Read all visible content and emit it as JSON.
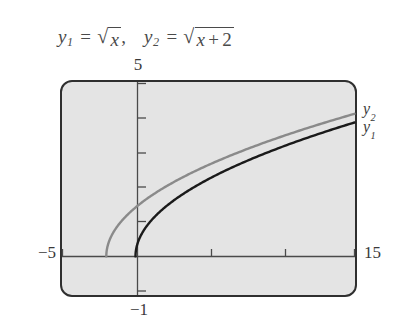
{
  "caption": {
    "eq1": {
      "var": "y",
      "sub": "1",
      "equals": "=",
      "radical": "√",
      "radicand": "x",
      "trailing": ","
    },
    "eq2": {
      "var": "y",
      "sub": "2",
      "equals": "=",
      "radical": "√",
      "radicand_var": "x",
      "operator": "+",
      "radicand_num": "2"
    },
    "plain_text": "y₁ = √x,  y₂ = √(x + 2)"
  },
  "axis_labels": {
    "y_max": "5",
    "y_min": "−1",
    "x_min": "−5",
    "x_max": "15"
  },
  "curve_labels": {
    "y2": {
      "var": "y",
      "sub": "2"
    },
    "y1": {
      "var": "y",
      "sub": "1"
    }
  },
  "colors": {
    "plot_fill": "#e4e4e4",
    "frame_border": "#2f2f2f",
    "axis": "#4a4a4a",
    "curve_y1": "#1a1a1a",
    "curve_y2": "#8a8a8a",
    "text": "#3a3a3a",
    "page_background": "#ffffff"
  },
  "chart_data": {
    "type": "line",
    "xlabel": "",
    "ylabel": "",
    "xlim": [
      -5,
      15
    ],
    "ylim": [
      -1,
      5
    ],
    "grid": false,
    "legend_position": "right-of-curve-ends",
    "x_ticks": [
      -5,
      0,
      5,
      10,
      15
    ],
    "y_ticks": [
      -1,
      0,
      1,
      2,
      3,
      4,
      5
    ],
    "tick_labels_shown": [
      "-5",
      "15",
      "5",
      "-1"
    ],
    "series": [
      {
        "name": "y₁",
        "expression": "sqrt(x)",
        "color": "#1a1a1a",
        "domain": [
          0,
          15
        ],
        "points": [
          {
            "x": 0,
            "y": 0
          },
          {
            "x": 0.25,
            "y": 0.5
          },
          {
            "x": 1,
            "y": 1
          },
          {
            "x": 2,
            "y": 1.414
          },
          {
            "x": 3,
            "y": 1.732
          },
          {
            "x": 4,
            "y": 2
          },
          {
            "x": 5,
            "y": 2.236
          },
          {
            "x": 6,
            "y": 2.449
          },
          {
            "x": 7,
            "y": 2.646
          },
          {
            "x": 8,
            "y": 2.828
          },
          {
            "x": 9,
            "y": 3
          },
          {
            "x": 10,
            "y": 3.162
          },
          {
            "x": 11,
            "y": 3.317
          },
          {
            "x": 12,
            "y": 3.464
          },
          {
            "x": 13,
            "y": 3.606
          },
          {
            "x": 14,
            "y": 3.742
          },
          {
            "x": 15,
            "y": 3.873
          }
        ]
      },
      {
        "name": "y₂",
        "expression": "sqrt(x + 2)",
        "color": "#8a8a8a",
        "domain": [
          -2,
          15
        ],
        "points": [
          {
            "x": -2,
            "y": 0
          },
          {
            "x": -1.75,
            "y": 0.5
          },
          {
            "x": -1,
            "y": 1
          },
          {
            "x": 0,
            "y": 1.414
          },
          {
            "x": 1,
            "y": 1.732
          },
          {
            "x": 2,
            "y": 2
          },
          {
            "x": 3,
            "y": 2.236
          },
          {
            "x": 4,
            "y": 2.449
          },
          {
            "x": 5,
            "y": 2.646
          },
          {
            "x": 6,
            "y": 2.828
          },
          {
            "x": 7,
            "y": 3
          },
          {
            "x": 8,
            "y": 3.162
          },
          {
            "x": 9,
            "y": 3.317
          },
          {
            "x": 10,
            "y": 3.464
          },
          {
            "x": 11,
            "y": 3.606
          },
          {
            "x": 12,
            "y": 3.742
          },
          {
            "x": 13,
            "y": 3.873
          },
          {
            "x": 14,
            "y": 4
          },
          {
            "x": 15,
            "y": 4.123
          }
        ]
      }
    ]
  }
}
